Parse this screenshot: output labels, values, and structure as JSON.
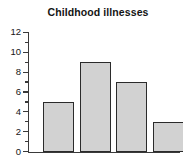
{
  "chart_data": {
    "type": "bar",
    "title": "Childhood illnesses",
    "xlabel": "",
    "ylabel": "",
    "categories": [
      "1",
      "2",
      "3",
      "4"
    ],
    "values": [
      5,
      9,
      7,
      3
    ],
    "ylim": [
      0,
      12
    ],
    "y_major_ticks": [
      0,
      2,
      4,
      6,
      8,
      10,
      12
    ],
    "y_tick_labels": [
      "0",
      "2",
      "4",
      "6",
      "8",
      "10",
      "12"
    ],
    "y_minor_ticks": [
      1,
      3,
      5,
      7,
      9,
      11
    ],
    "x_tick_labels": [],
    "grid": false,
    "legend": false,
    "bar_fill_color": "#d2d2d2",
    "bar_edge_color": "#2b2b2b",
    "axis_color": "#3a3a3a",
    "background_color": "#ffffff"
  }
}
